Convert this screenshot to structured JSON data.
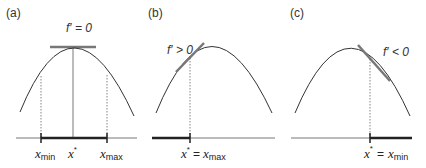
{
  "figure": {
    "panels": [
      {
        "id": "a",
        "label": "(a)",
        "derivative_label": "f′ = 0",
        "x_labels": [
          {
            "base": "x",
            "sub": "min"
          },
          {
            "base": "x",
            "sup": "*"
          },
          {
            "base": "x",
            "sub": "max"
          }
        ],
        "description": "Maximum in interior: tangent horizontal at x*, between x_min and x_max"
      },
      {
        "id": "b",
        "label": "(b)",
        "derivative_label": "f′ > 0",
        "x_label": {
          "base": "x",
          "sup": "*",
          "eq": "=",
          "rhs": "x",
          "rhs_sub": "max"
        },
        "description": "Increasing at upper bound: optimum at x* = x_max"
      },
      {
        "id": "c",
        "label": "(c)",
        "derivative_label": "f′ < 0",
        "x_label": {
          "base": "x",
          "sup": "*",
          "eq": "=",
          "rhs": "x",
          "rhs_sub": "min"
        },
        "description": "Decreasing at lower bound: optimum at x* = x_min"
      }
    ],
    "colors": {
      "curve": "#333333",
      "tangent": "#777777",
      "axis": "#555555",
      "interval": "#222222",
      "guide": "#666666"
    }
  }
}
